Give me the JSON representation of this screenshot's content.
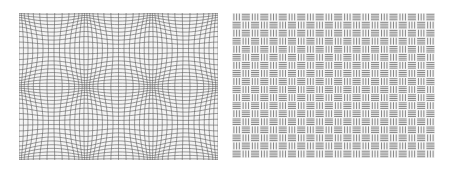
{
  "figure": {
    "panels": [
      {
        "id": "warped-grid",
        "description": "Grid distorted into a lattice of bulging spheres",
        "pattern": "bulge-grid",
        "grid_lines": 44,
        "sphere_columns": 3,
        "sphere_rows": 2,
        "line_color": "#5a5a5a",
        "background_color": "#f4f4f4"
      },
      {
        "id": "hatched-checkerboard",
        "description": "Checkerboard of alternating horizontal and vertical line-hatched cells",
        "pattern": "hatch-checker",
        "cell_columns": 22,
        "cell_rows": 18,
        "line_color": "#6a6a6a",
        "background_color": "#f6f6f6"
      }
    ]
  }
}
